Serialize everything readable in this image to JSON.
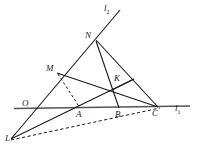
{
  "figure": {
    "type": "euclidean-geometry-diagram",
    "stroke_color": "#1a1a1a",
    "background_color": "#ffffff",
    "baseline_color": "#555555"
  },
  "points": [
    {
      "id": "L",
      "label": "L",
      "x": 11,
      "y": 139,
      "label_x": 5,
      "label_y": 138
    },
    {
      "id": "O",
      "label": "O",
      "x": 33,
      "y": 107,
      "label_x": 22,
      "label_y": 99
    },
    {
      "id": "M",
      "label": "M",
      "x": 57,
      "y": 73,
      "label_x": 46,
      "label_y": 64
    },
    {
      "id": "N",
      "label": "N",
      "x": 96,
      "y": 40,
      "label_x": 85,
      "label_y": 31
    },
    {
      "id": "A",
      "label": "A",
      "x": 80,
      "y": 108,
      "label_x": 75,
      "label_y": 111
    },
    {
      "id": "B",
      "label": "B",
      "x": 119,
      "y": 108,
      "label_x": 114,
      "label_y": 111
    },
    {
      "id": "C",
      "label": "C",
      "x": 157,
      "y": 107,
      "label_x": 152,
      "label_y": 110
    },
    {
      "id": "K",
      "label": "K",
      "x": 118,
      "y": 86,
      "label_x": 113,
      "label_y": 74
    }
  ],
  "lines": [
    {
      "id": "l1",
      "label": "l",
      "subscript": "1",
      "label_x": 175,
      "label_y": 108
    },
    {
      "id": "l2",
      "label": "l",
      "subscript": "2",
      "label_x": 105,
      "label_y": 6
    }
  ],
  "segments": [
    {
      "id": "line-l1",
      "from": "O-left",
      "to": "l1-right",
      "style": "solid-thick"
    },
    {
      "id": "ray-l2",
      "from": "L",
      "to": "l2-top",
      "style": "solid"
    },
    {
      "id": "seg-L-K-stub",
      "from": "L",
      "to": "K-stub",
      "style": "solid"
    },
    {
      "id": "seg-L-C",
      "from": "L",
      "to": "C",
      "style": "dashed"
    },
    {
      "id": "seg-M-C",
      "from": "M",
      "to": "C",
      "style": "solid"
    },
    {
      "id": "seg-N-C",
      "from": "N",
      "to": "C",
      "style": "solid"
    },
    {
      "id": "seg-N-B",
      "from": "N",
      "to": "B",
      "style": "solid"
    },
    {
      "id": "seg-M-A",
      "from": "M",
      "to": "A",
      "style": "dashed"
    },
    {
      "id": "seg-K-stub",
      "from": "K",
      "to": "K-upper",
      "style": "solid"
    }
  ]
}
